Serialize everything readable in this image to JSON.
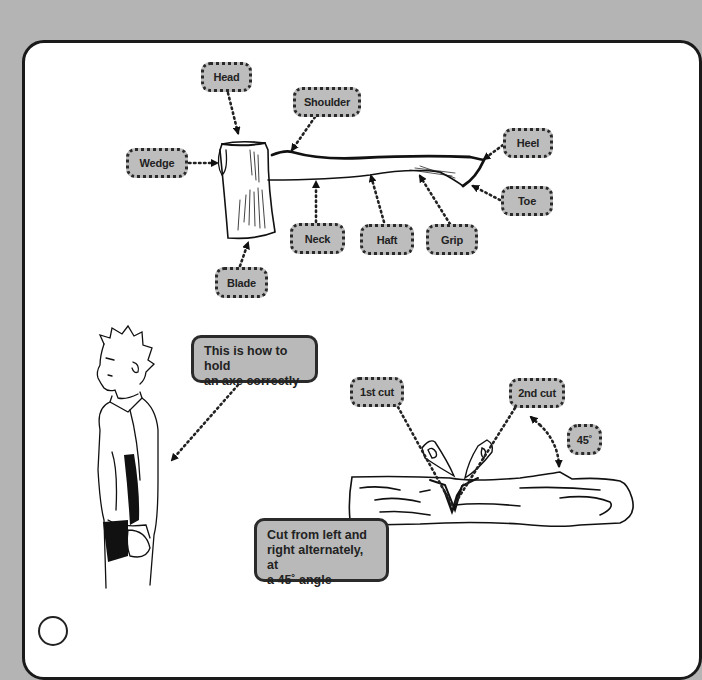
{
  "diagram": {
    "axe_labels": [
      {
        "id": "head",
        "label": "Head"
      },
      {
        "id": "shoulder",
        "label": "Shoulder"
      },
      {
        "id": "wedge",
        "label": "Wedge"
      },
      {
        "id": "heel",
        "label": "Heel"
      },
      {
        "id": "toe",
        "label": "Toe"
      },
      {
        "id": "neck",
        "label": "Neck"
      },
      {
        "id": "haft",
        "label": "Haft"
      },
      {
        "id": "grip",
        "label": "Grip"
      },
      {
        "id": "blade",
        "label": "Blade"
      }
    ],
    "holding_note": {
      "lines": [
        "This is how to hold",
        "an axe correctly"
      ]
    },
    "cutting_labels": [
      {
        "id": "first-cut",
        "label": "1st cut"
      },
      {
        "id": "second-cut",
        "label": "2nd cut"
      },
      {
        "id": "angle",
        "label": "45˚"
      }
    ],
    "cutting_note": {
      "lines": [
        "Cut from left and",
        "right alternately, at",
        "a 45˚ angle"
      ]
    },
    "colors": {
      "background": "#b4b4b4",
      "panel": "#ffffff",
      "label_fill": "#bdbdbd",
      "ink": "#222222"
    }
  }
}
